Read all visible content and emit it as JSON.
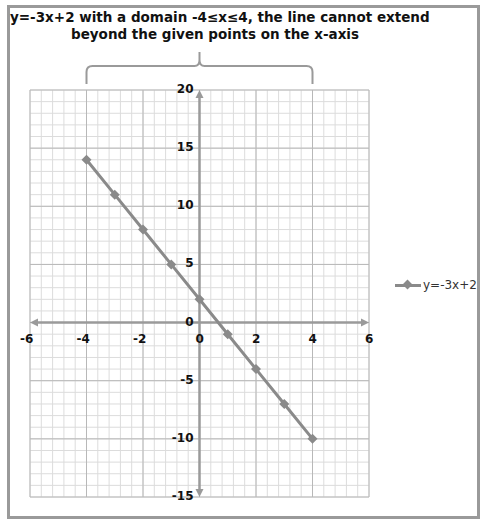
{
  "title": {
    "line1": "y=-3x+2  with a domain -4≤x≤4, the line cannot extend",
    "line2": "beyond the given points on the x-axis"
  },
  "legend": {
    "label": "y=-3x+2",
    "icon": "line-diamond-marker-icon"
  },
  "chart_data": {
    "type": "line",
    "title": "y=-3x+2  with a domain -4≤x≤4, the line cannot extend beyond the given points on the x-axis",
    "xlabel": "",
    "ylabel": "",
    "x": [
      -4,
      -3,
      -2,
      -1,
      0,
      1,
      2,
      3,
      4
    ],
    "series": [
      {
        "name": "y=-3x+2",
        "values": [
          14,
          11,
          8,
          5,
          2,
          -1,
          -4,
          -7,
          -10
        ],
        "color": "#8a8a8a",
        "marker": "diamond"
      }
    ],
    "xlim": [
      -6,
      6
    ],
    "ylim": [
      -15,
      20
    ],
    "xticks": [
      "-6",
      "-4",
      "-2",
      "0",
      "2",
      "4",
      "6"
    ],
    "yticks": [
      "20",
      "15",
      "10",
      "5",
      "0",
      "-5",
      "-10",
      "-15"
    ],
    "grid": true,
    "legend_position": "right",
    "annotations": [
      "brace spanning x=-4 to x=4 above plot area"
    ]
  },
  "colors": {
    "series": "#8a8a8a",
    "frame": "#9a9a9a",
    "grid_minor": "#dcdcdc",
    "grid_major": "#b8b8b8",
    "axis": "#9a9a9a"
  }
}
